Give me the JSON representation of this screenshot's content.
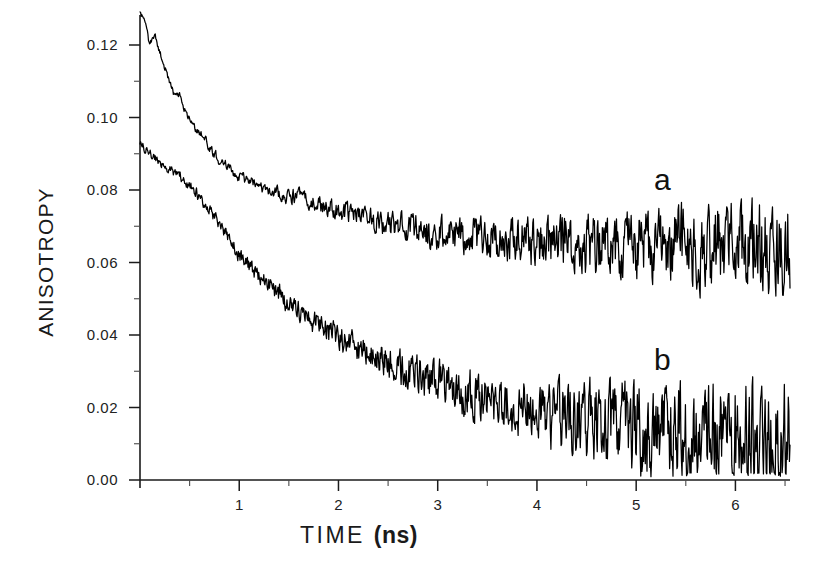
{
  "figure": {
    "background": "#ffffff",
    "ink_color": "#111111"
  },
  "chart_data": {
    "type": "line",
    "title": "",
    "xlabel": "TIME",
    "xlabel_unit": "(ns)",
    "ylabel": "ANISOTROPY",
    "xlim": [
      0,
      6.55
    ],
    "ylim": [
      0.0,
      0.132
    ],
    "grid": false,
    "legend_position": "inline-annotations",
    "x_ticks": [
      1,
      2,
      3,
      4,
      5,
      6
    ],
    "x_tick_labels": [
      "1",
      "2",
      "3",
      "4",
      "5",
      "6"
    ],
    "x_minor_ticks": [
      0.5,
      1.5,
      2.5,
      3.5,
      4.5,
      5.5,
      6.5
    ],
    "y_ticks": [
      0.0,
      0.02,
      0.04,
      0.06,
      0.08,
      0.1,
      0.12
    ],
    "y_tick_labels": [
      "0.00",
      "0.02",
      "0.04",
      "0.06",
      "0.08",
      "0.10",
      "0.12"
    ],
    "y_minor_ticks": [
      0.01,
      0.03,
      0.05,
      0.07,
      0.09,
      0.11
    ],
    "annotations": [
      {
        "text": "a",
        "x": 5.15,
        "y": 0.0805,
        "series": "a"
      },
      {
        "text": "b",
        "x": 5.15,
        "y": 0.0305,
        "series": "b"
      }
    ],
    "series": [
      {
        "name": "a",
        "label": "a",
        "color": "#000000",
        "description": "upper anisotropy decay, plateaus near 0.065",
        "baseline": 0.0645,
        "initial": 0.128,
        "decay_ns": 1.35,
        "noise_start_ns": 0.35,
        "noise_level_end": 0.0085,
        "x": [
          0.0,
          0.05,
          0.1,
          0.15,
          0.2,
          0.25,
          0.3,
          0.35,
          0.4,
          0.45,
          0.5,
          0.55,
          0.6,
          0.65,
          0.7,
          0.75,
          0.8,
          0.85,
          0.9,
          0.95,
          1.0,
          1.1,
          1.2,
          1.3,
          1.4,
          1.5,
          1.6,
          1.7,
          1.8,
          1.9,
          2.0,
          2.2,
          2.4,
          2.6,
          2.8,
          3.0,
          3.2,
          3.4,
          3.6,
          3.8,
          4.0,
          4.2,
          4.4,
          4.6,
          4.8,
          5.0,
          5.2,
          5.4,
          5.6,
          5.8,
          6.0,
          6.2,
          6.4
        ],
        "y": [
          0.1285,
          0.1262,
          0.1205,
          0.1222,
          0.1178,
          0.113,
          0.1098,
          0.1062,
          0.1068,
          0.1022,
          0.0998,
          0.0972,
          0.096,
          0.0942,
          0.0916,
          0.09,
          0.0882,
          0.0878,
          0.0862,
          0.0846,
          0.0838,
          0.0822,
          0.0808,
          0.08,
          0.0792,
          0.078,
          0.0786,
          0.0772,
          0.076,
          0.0752,
          0.0744,
          0.0726,
          0.0712,
          0.07,
          0.0692,
          0.068,
          0.0672,
          0.0668,
          0.066,
          0.0664,
          0.0656,
          0.0652,
          0.0648,
          0.0646,
          0.0644,
          0.065,
          0.0642,
          0.0648,
          0.064,
          0.0644,
          0.0646,
          0.064,
          0.0648
        ]
      },
      {
        "name": "b",
        "label": "b",
        "color": "#000000",
        "description": "lower anisotropy decay, continues toward 0.01",
        "baseline": 0.0095,
        "initial": 0.0935,
        "decay_ns": 2.1,
        "noise_start_ns": 0.05,
        "noise_level_end": 0.0105,
        "x": [
          0.0,
          0.05,
          0.1,
          0.15,
          0.2,
          0.25,
          0.3,
          0.35,
          0.4,
          0.45,
          0.5,
          0.55,
          0.6,
          0.65,
          0.7,
          0.75,
          0.8,
          0.85,
          0.9,
          0.95,
          1.0,
          1.1,
          1.2,
          1.3,
          1.4,
          1.5,
          1.6,
          1.7,
          1.8,
          1.9,
          2.0,
          2.2,
          2.4,
          2.6,
          2.8,
          3.0,
          3.2,
          3.4,
          3.6,
          3.8,
          4.0,
          4.2,
          4.4,
          4.6,
          4.8,
          5.0,
          5.2,
          5.4,
          5.6,
          5.8,
          6.0,
          6.2,
          6.4
        ],
        "y": [
          0.0935,
          0.0916,
          0.0902,
          0.0888,
          0.0876,
          0.0862,
          0.0858,
          0.0842,
          0.084,
          0.0826,
          0.0812,
          0.08,
          0.0782,
          0.0766,
          0.0742,
          0.0726,
          0.07,
          0.0684,
          0.066,
          0.0642,
          0.0622,
          0.059,
          0.0562,
          0.0538,
          0.0512,
          0.0488,
          0.047,
          0.0448,
          0.0426,
          0.0408,
          0.0392,
          0.036,
          0.0336,
          0.031,
          0.0288,
          0.0268,
          0.0248,
          0.0232,
          0.0216,
          0.0202,
          0.019,
          0.0178,
          0.0168,
          0.0158,
          0.015,
          0.0142,
          0.0136,
          0.013,
          0.0126,
          0.012,
          0.0118,
          0.0114,
          0.0112
        ]
      }
    ]
  }
}
